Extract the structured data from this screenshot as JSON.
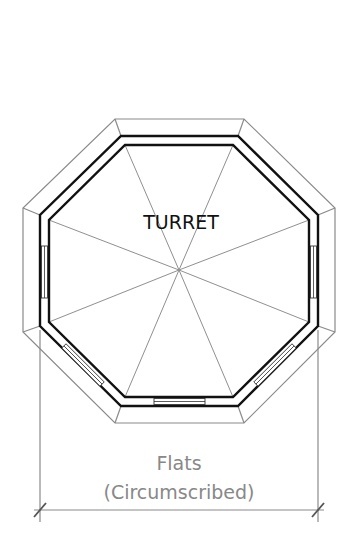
{
  "diagram": {
    "title": "TURRET",
    "dimension": {
      "line1": "Flats",
      "line2": "(Circumscribed)"
    },
    "colors": {
      "background": "#ffffff",
      "wall": "#111111",
      "thin_line": "#8a8a8a",
      "dimension_text": "#888888"
    },
    "shape": "octagon",
    "rays": 8
  }
}
